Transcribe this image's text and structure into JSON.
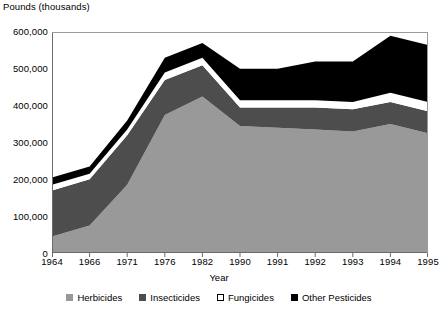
{
  "chart_data": {
    "type": "area",
    "stacked": true,
    "title": "",
    "ylabel": "Pounds (thousands)",
    "xlabel": "Year",
    "categories": [
      "1964",
      "1966",
      "1971",
      "1976",
      "1982",
      "1990",
      "1991",
      "1992",
      "1993",
      "1994",
      "1995"
    ],
    "ylim": [
      0,
      600000
    ],
    "yticks": [
      0,
      100000,
      200000,
      300000,
      400000,
      500000,
      600000
    ],
    "ytick_labels": [
      "0",
      "100,000",
      "200,000",
      "300,000",
      "400,000",
      "500,000",
      "600,000"
    ],
    "grid": false,
    "legend_position": "bottom",
    "series": [
      {
        "name": "Herbicides",
        "color": "#999999",
        "values": [
          45000,
          75000,
          185000,
          375000,
          425000,
          345000,
          340000,
          335000,
          330000,
          350000,
          325000
        ]
      },
      {
        "name": "Insecticides",
        "color": "#4d4d4d",
        "values": [
          125000,
          125000,
          135000,
          95000,
          85000,
          50000,
          55000,
          60000,
          60000,
          60000,
          60000
        ]
      },
      {
        "name": "Fungicides",
        "color": "#ffffff",
        "values": [
          15000,
          15000,
          15000,
          20000,
          20000,
          20000,
          20000,
          20000,
          20000,
          25000,
          25000
        ]
      },
      {
        "name": "Other Pesticides",
        "color": "#000000",
        "values": [
          20000,
          20000,
          25000,
          40000,
          40000,
          85000,
          85000,
          105000,
          110000,
          155000,
          155000
        ]
      }
    ],
    "totals": [
      205000,
      235000,
      360000,
      530000,
      570000,
      500000,
      500000,
      520000,
      520000,
      590000,
      565000
    ]
  },
  "legend": {
    "items": [
      {
        "label": "Herbicides",
        "color": "#999999"
      },
      {
        "label": "Insecticides",
        "color": "#4d4d4d"
      },
      {
        "label": "Fungicides",
        "color": "#ffffff"
      },
      {
        "label": "Other Pesticides",
        "color": "#000000"
      }
    ]
  }
}
